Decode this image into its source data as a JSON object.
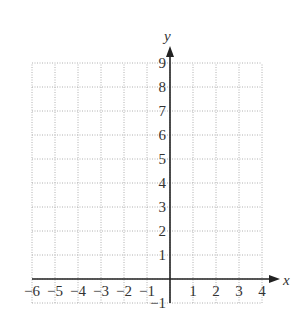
{
  "chart_data": {
    "type": "scatter",
    "title": "",
    "xlabel": "x",
    "ylabel": "y",
    "xlim": [
      -6,
      4
    ],
    "ylim": [
      -1,
      9
    ],
    "grid": true,
    "grid_style": "dotted",
    "x_ticks": [
      -6,
      -5,
      -4,
      -3,
      -2,
      -1,
      1,
      2,
      3,
      4
    ],
    "y_ticks": [
      -1,
      1,
      2,
      3,
      4,
      5,
      6,
      7,
      8,
      9
    ],
    "x_tick_labels": [
      "−6",
      "−5",
      "−4",
      "−3",
      "−2",
      "−1",
      "1",
      "2",
      "3",
      "4"
    ],
    "y_tick_labels": [
      "−1",
      "1",
      "2",
      "3",
      "4",
      "5",
      "6",
      "7",
      "8",
      "9"
    ],
    "series": [],
    "legend": null
  },
  "colors": {
    "axis": "#222222",
    "grid": "#b0b0b0",
    "text": "#333333"
  }
}
